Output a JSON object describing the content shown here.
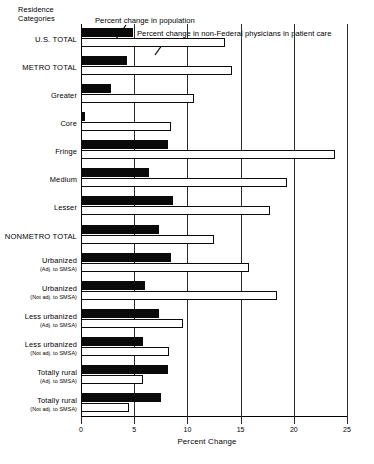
{
  "chart_data": {
    "type": "bar",
    "orientation": "horizontal",
    "title": "",
    "ylabel": "Residence\nCategories",
    "xlabel": "Percent Change",
    "xlim": [
      0,
      25
    ],
    "xticks": [
      0,
      5,
      10,
      15,
      20,
      25
    ],
    "xticklabels": [
      "0",
      "5",
      "10",
      "15",
      "20",
      "25"
    ],
    "grid": true,
    "legend_position": "top",
    "categories": [
      {
        "label": "U.S. TOTAL",
        "sub": "",
        "emphasis": true
      },
      {
        "label": "METRO TOTAL",
        "sub": "",
        "emphasis": true
      },
      {
        "label": "Greater",
        "sub": "",
        "emphasis": false
      },
      {
        "label": "Core",
        "sub": "",
        "emphasis": false
      },
      {
        "label": "Fringe",
        "sub": "",
        "emphasis": false
      },
      {
        "label": "Medium",
        "sub": "",
        "emphasis": false
      },
      {
        "label": "Lesser",
        "sub": "",
        "emphasis": false
      },
      {
        "label": "NONMETRO TOTAL",
        "sub": "",
        "emphasis": true
      },
      {
        "label": "Urbanized",
        "sub": "(Adj. to SMSA)",
        "emphasis": false
      },
      {
        "label": "Urbanized",
        "sub": "(Not adj. to SMSA)",
        "emphasis": false
      },
      {
        "label": "Less urbanized",
        "sub": "(Adj. to SMSA)",
        "emphasis": false
      },
      {
        "label": "Less urbanized",
        "sub": "(Not adj. to SMSA)",
        "emphasis": false
      },
      {
        "label": "Totally rural",
        "sub": "(Adj. to SMSA)",
        "emphasis": false
      },
      {
        "label": "Totally rural",
        "sub": "(Not adj. to SMSA)",
        "emphasis": false
      }
    ],
    "series": [
      {
        "name": "Percent change in population",
        "key": "pop",
        "color": "#0a0a0a",
        "values": [
          4.9,
          4.3,
          2.8,
          0.4,
          8.2,
          6.4,
          8.6,
          7.3,
          8.5,
          6.0,
          7.3,
          5.8,
          8.2,
          7.5
        ]
      },
      {
        "name": "Percent change in non-Federal physicians in patient care",
        "key": "phys",
        "color": "#ffffff",
        "values": [
          13.5,
          14.2,
          10.6,
          8.5,
          23.9,
          19.4,
          17.8,
          12.5,
          15.8,
          18.4,
          9.6,
          8.3,
          5.8,
          4.5
        ]
      }
    ]
  },
  "legend": {
    "population_label": "Percent change in population",
    "physicians_label": "Percent change in non-Federal physicians in patient care"
  }
}
